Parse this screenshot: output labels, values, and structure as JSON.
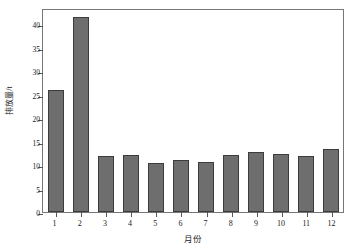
{
  "chart_data": {
    "type": "bar",
    "title": "",
    "subtitle": "",
    "xlabel": "月份",
    "ylabel": "排放量/t",
    "categories": [
      "1",
      "2",
      "3",
      "4",
      "5",
      "6",
      "7",
      "8",
      "9",
      "10",
      "11",
      "12"
    ],
    "values": [
      26.0,
      41.5,
      12.0,
      12.1,
      10.5,
      11.1,
      10.7,
      12.1,
      12.7,
      12.4,
      12.0,
      13.5
    ],
    "series": [
      {
        "name": "排放量",
        "values": [
          26.0,
          41.5,
          12.0,
          12.1,
          10.5,
          11.1,
          10.7,
          12.1,
          12.7,
          12.4,
          12.0,
          13.5
        ]
      }
    ],
    "ylim": [
      0,
      43.5
    ],
    "xlim": [
      0.5,
      12.5
    ],
    "yticks": [
      0,
      5,
      10,
      15,
      20,
      25,
      30,
      35,
      40
    ],
    "ytick_labels": [
      "0",
      "5",
      "10",
      "15",
      "20",
      "25",
      "30",
      "35",
      "40"
    ],
    "xticks": [
      1,
      2,
      3,
      4,
      5,
      6,
      7,
      8,
      9,
      10,
      11,
      12
    ],
    "xtick_labels": [
      "1",
      "2",
      "3",
      "4",
      "5",
      "6",
      "7",
      "8",
      "9",
      "10",
      "11",
      "12"
    ],
    "grid": false,
    "legend": false,
    "legend_position": "none",
    "bar_color": "#6e6e6e",
    "bar_edge_color": "#3c3c3c",
    "frame_color": "#777777",
    "background_color": "#ffffff",
    "text_color": "#1a1a1a",
    "annotations": []
  }
}
